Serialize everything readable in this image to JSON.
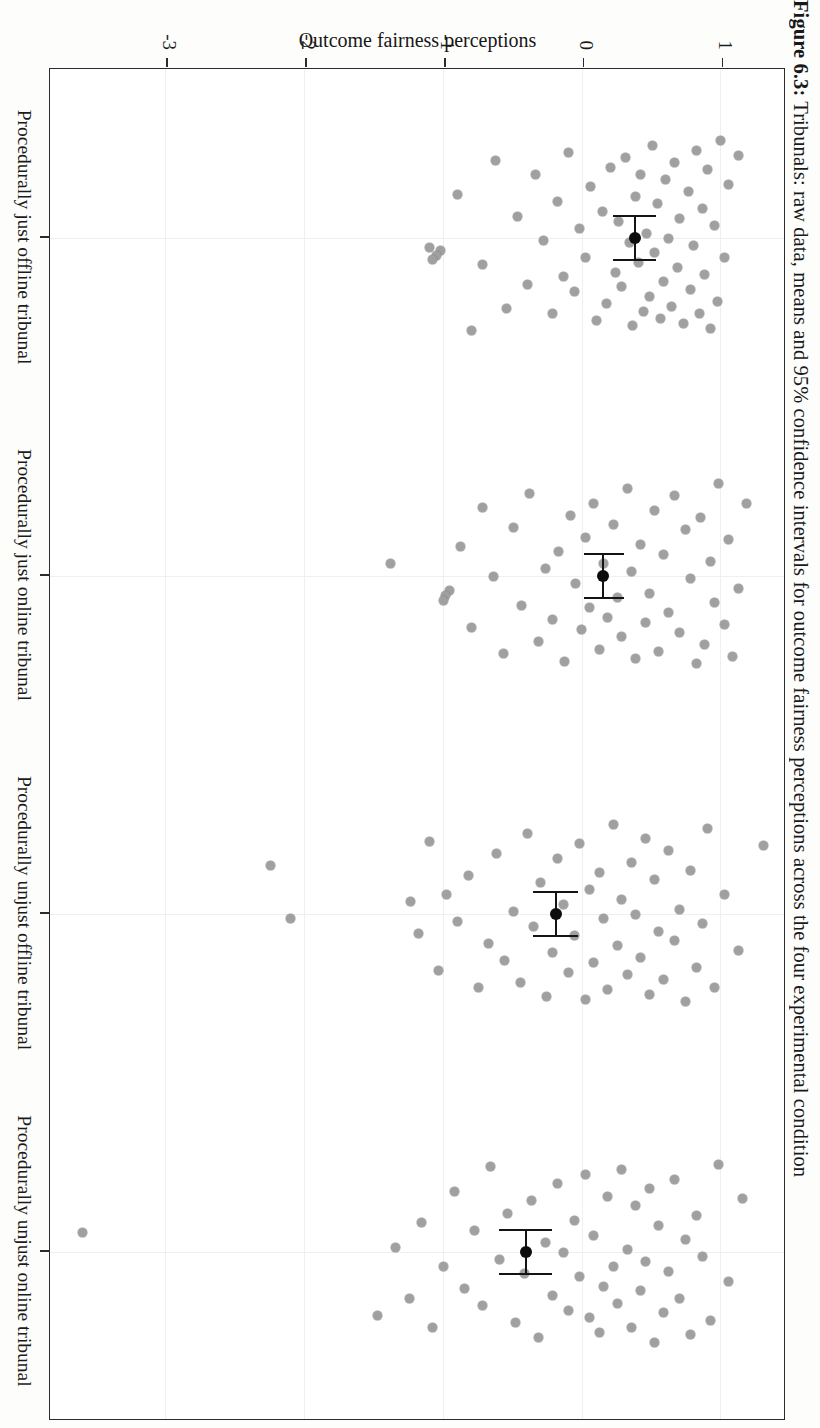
{
  "caption": {
    "lead": "Figure 6.3:",
    "rest": " Tribunals: raw data, means and 95% confidence intervals for outcome fairness perceptions across the four experimental condition"
  },
  "chart_data": {
    "type": "scatter",
    "title": "Figure 6.3: Tribunals: raw data, means and 95% confidence intervals for outcome fairness perceptions across the four experimental condition",
    "xlabel": "",
    "ylabel": "Outcome fairness perceptions",
    "ylim": [
      -3.85,
      1.45
    ],
    "yticks": [
      1,
      0,
      -1,
      -2,
      -3
    ],
    "ytick_labels": [
      "1",
      "0",
      "-1",
      "-2",
      "-3"
    ],
    "grid": true,
    "legend": "none",
    "orientation": "rotated-90ccw-scan",
    "categories": [
      "Procedurally just offline tribunal",
      "Procedurally just online tribunal",
      "Procedurally unjust offline tribunal",
      "Procedurally unjust online tribunal"
    ],
    "series": [
      {
        "name": "Mean with 95% CI",
        "means": [
          0.38,
          0.15,
          -0.19,
          -0.41
        ],
        "ci_low": [
          0.22,
          0.01,
          -0.36,
          -0.6
        ],
        "ci_high": [
          0.53,
          0.3,
          -0.03,
          -0.22
        ]
      }
    ],
    "raw_points": {
      "Procedurally just offline tribunal": [
        {
          "v": 1.12,
          "j": -0.34
        },
        {
          "v": 1.05,
          "j": -0.22
        },
        {
          "v": 1.02,
          "j": 0.08
        },
        {
          "v": 0.99,
          "j": -0.4
        },
        {
          "v": 0.97,
          "j": 0.26
        },
        {
          "v": 0.95,
          "j": -0.05
        },
        {
          "v": 0.92,
          "j": 0.37
        },
        {
          "v": 0.9,
          "j": -0.28
        },
        {
          "v": 0.88,
          "j": 0.15
        },
        {
          "v": 0.86,
          "j": -0.12
        },
        {
          "v": 0.84,
          "j": 0.31
        },
        {
          "v": 0.82,
          "j": -0.36
        },
        {
          "v": 0.8,
          "j": 0.03
        },
        {
          "v": 0.78,
          "j": 0.21
        },
        {
          "v": 0.76,
          "j": -0.19
        },
        {
          "v": 0.73,
          "j": 0.35
        },
        {
          "v": 0.7,
          "j": -0.08
        },
        {
          "v": 0.68,
          "j": 0.12
        },
        {
          "v": 0.66,
          "j": -0.31
        },
        {
          "v": 0.64,
          "j": 0.28
        },
        {
          "v": 0.62,
          "j": 0.0
        },
        {
          "v": 0.6,
          "j": -0.24
        },
        {
          "v": 0.58,
          "j": 0.18
        },
        {
          "v": 0.56,
          "j": 0.33
        },
        {
          "v": 0.54,
          "j": -0.14
        },
        {
          "v": 0.52,
          "j": 0.06
        },
        {
          "v": 0.5,
          "j": -0.38
        },
        {
          "v": 0.48,
          "j": 0.24
        },
        {
          "v": 0.46,
          "j": -0.02
        },
        {
          "v": 0.44,
          "j": 0.3
        },
        {
          "v": 0.42,
          "j": -0.26
        },
        {
          "v": 0.4,
          "j": 0.1
        },
        {
          "v": 0.38,
          "j": -0.17
        },
        {
          "v": 0.36,
          "j": 0.36
        },
        {
          "v": 0.34,
          "j": 0.02
        },
        {
          "v": 0.31,
          "j": -0.33
        },
        {
          "v": 0.28,
          "j": 0.2
        },
        {
          "v": 0.26,
          "j": -0.07
        },
        {
          "v": 0.24,
          "j": 0.14
        },
        {
          "v": 0.2,
          "j": -0.29
        },
        {
          "v": 0.17,
          "j": 0.27
        },
        {
          "v": 0.14,
          "j": -0.11
        },
        {
          "v": 0.1,
          "j": 0.34
        },
        {
          "v": 0.06,
          "j": -0.21
        },
        {
          "v": 0.02,
          "j": 0.08
        },
        {
          "v": -0.02,
          "j": -0.04
        },
        {
          "v": -0.06,
          "j": 0.22
        },
        {
          "v": -0.1,
          "j": -0.35
        },
        {
          "v": -0.14,
          "j": 0.16
        },
        {
          "v": -0.18,
          "j": -0.15
        },
        {
          "v": -0.22,
          "j": 0.31
        },
        {
          "v": -0.28,
          "j": 0.01
        },
        {
          "v": -0.34,
          "j": -0.26
        },
        {
          "v": -0.4,
          "j": 0.19
        },
        {
          "v": -0.47,
          "j": -0.09
        },
        {
          "v": -0.55,
          "j": 0.29
        },
        {
          "v": -0.63,
          "j": -0.32
        },
        {
          "v": -0.72,
          "j": 0.11
        },
        {
          "v": -0.8,
          "j": 0.38
        },
        {
          "v": -0.9,
          "j": -0.18
        },
        {
          "v": -1.02,
          "j": 0.05
        },
        {
          "v": -1.05,
          "j": 0.07
        },
        {
          "v": -1.08,
          "j": 0.09
        },
        {
          "v": -1.1,
          "j": 0.04
        }
      ],
      "Procedurally just online tribunal": [
        {
          "v": 1.18,
          "j": -0.3
        },
        {
          "v": 1.12,
          "j": 0.05
        },
        {
          "v": 1.08,
          "j": 0.33
        },
        {
          "v": 1.05,
          "j": -0.15
        },
        {
          "v": 1.02,
          "j": 0.2
        },
        {
          "v": 0.98,
          "j": -0.38
        },
        {
          "v": 0.95,
          "j": 0.11
        },
        {
          "v": 0.92,
          "j": -0.06
        },
        {
          "v": 0.88,
          "j": 0.28
        },
        {
          "v": 0.85,
          "j": -0.24
        },
        {
          "v": 0.82,
          "j": 0.36
        },
        {
          "v": 0.78,
          "j": 0.01
        },
        {
          "v": 0.74,
          "j": -0.19
        },
        {
          "v": 0.7,
          "j": 0.23
        },
        {
          "v": 0.66,
          "j": -0.33
        },
        {
          "v": 0.62,
          "j": 0.15
        },
        {
          "v": 0.58,
          "j": -0.09
        },
        {
          "v": 0.55,
          "j": 0.31
        },
        {
          "v": 0.52,
          "j": -0.27
        },
        {
          "v": 0.48,
          "j": 0.07
        },
        {
          "v": 0.45,
          "j": 0.19
        },
        {
          "v": 0.42,
          "j": -0.13
        },
        {
          "v": 0.38,
          "j": 0.34
        },
        {
          "v": 0.35,
          "j": -0.02
        },
        {
          "v": 0.32,
          "j": -0.36
        },
        {
          "v": 0.28,
          "j": 0.25
        },
        {
          "v": 0.25,
          "j": 0.09
        },
        {
          "v": 0.22,
          "j": -0.21
        },
        {
          "v": 0.18,
          "j": 0.17
        },
        {
          "v": 0.15,
          "j": -0.05
        },
        {
          "v": 0.12,
          "j": 0.3
        },
        {
          "v": 0.08,
          "j": -0.3
        },
        {
          "v": 0.05,
          "j": 0.13
        },
        {
          "v": 0.02,
          "j": -0.16
        },
        {
          "v": -0.01,
          "j": 0.22
        },
        {
          "v": -0.05,
          "j": 0.03
        },
        {
          "v": -0.09,
          "j": -0.25
        },
        {
          "v": -0.13,
          "j": 0.35
        },
        {
          "v": -0.17,
          "j": -0.1
        },
        {
          "v": -0.22,
          "j": 0.18
        },
        {
          "v": -0.27,
          "j": -0.03
        },
        {
          "v": -0.32,
          "j": 0.27
        },
        {
          "v": -0.38,
          "j": -0.34
        },
        {
          "v": -0.44,
          "j": 0.12
        },
        {
          "v": -0.5,
          "j": -0.2
        },
        {
          "v": -0.57,
          "j": 0.32
        },
        {
          "v": -0.64,
          "j": 0.0
        },
        {
          "v": -0.72,
          "j": -0.28
        },
        {
          "v": -0.8,
          "j": 0.21
        },
        {
          "v": -0.88,
          "j": -0.12
        },
        {
          "v": -0.96,
          "j": 0.06
        },
        {
          "v": -0.99,
          "j": 0.08
        },
        {
          "v": -1.0,
          "j": 0.1
        },
        {
          "v": -1.38,
          "j": -0.05
        }
      ],
      "Procedurally unjust offline tribunal": [
        {
          "v": 1.3,
          "j": -0.28
        },
        {
          "v": 1.12,
          "j": 0.15
        },
        {
          "v": 1.02,
          "j": -0.08
        },
        {
          "v": 0.95,
          "j": 0.3
        },
        {
          "v": 0.9,
          "j": -0.35
        },
        {
          "v": 0.86,
          "j": 0.04
        },
        {
          "v": 0.82,
          "j": 0.22
        },
        {
          "v": 0.78,
          "j": -0.18
        },
        {
          "v": 0.74,
          "j": 0.36
        },
        {
          "v": 0.7,
          "j": -0.02
        },
        {
          "v": 0.66,
          "j": 0.11
        },
        {
          "v": 0.62,
          "j": -0.26
        },
        {
          "v": 0.58,
          "j": 0.27
        },
        {
          "v": 0.55,
          "j": 0.07
        },
        {
          "v": 0.52,
          "j": -0.14
        },
        {
          "v": 0.48,
          "j": 0.33
        },
        {
          "v": 0.45,
          "j": -0.31
        },
        {
          "v": 0.42,
          "j": 0.18
        },
        {
          "v": 0.38,
          "j": 0.0
        },
        {
          "v": 0.35,
          "j": -0.21
        },
        {
          "v": 0.32,
          "j": 0.25
        },
        {
          "v": 0.28,
          "j": -0.06
        },
        {
          "v": 0.25,
          "j": 0.13
        },
        {
          "v": 0.22,
          "j": -0.37
        },
        {
          "v": 0.18,
          "j": 0.31
        },
        {
          "v": 0.15,
          "j": 0.02
        },
        {
          "v": 0.12,
          "j": -0.17
        },
        {
          "v": 0.08,
          "j": 0.2
        },
        {
          "v": 0.05,
          "j": -0.1
        },
        {
          "v": 0.02,
          "j": 0.35
        },
        {
          "v": -0.02,
          "j": -0.29
        },
        {
          "v": -0.06,
          "j": 0.09
        },
        {
          "v": -0.1,
          "j": 0.24
        },
        {
          "v": -0.14,
          "j": -0.04
        },
        {
          "v": -0.18,
          "j": -0.23
        },
        {
          "v": -0.22,
          "j": 0.16
        },
        {
          "v": -0.26,
          "j": 0.34
        },
        {
          "v": -0.3,
          "j": -0.13
        },
        {
          "v": -0.35,
          "j": 0.05
        },
        {
          "v": -0.4,
          "j": -0.33
        },
        {
          "v": -0.45,
          "j": 0.28
        },
        {
          "v": -0.5,
          "j": -0.01
        },
        {
          "v": -0.56,
          "j": 0.19
        },
        {
          "v": -0.62,
          "j": -0.25
        },
        {
          "v": -0.68,
          "j": 0.12
        },
        {
          "v": -0.75,
          "j": 0.3
        },
        {
          "v": -0.82,
          "j": -0.16
        },
        {
          "v": -0.9,
          "j": 0.03
        },
        {
          "v": -0.98,
          "j": -0.08
        },
        {
          "v": -1.04,
          "j": 0.23
        },
        {
          "v": -1.1,
          "j": -0.3
        },
        {
          "v": -1.18,
          "j": 0.08
        },
        {
          "v": -1.24,
          "j": -0.05
        },
        {
          "v": -2.1,
          "j": 0.02
        },
        {
          "v": -2.25,
          "j": -0.2
        }
      ],
      "Procedurally unjust online tribunal": [
        {
          "v": 1.15,
          "j": -0.22
        },
        {
          "v": 1.05,
          "j": 0.12
        },
        {
          "v": 0.98,
          "j": -0.36
        },
        {
          "v": 0.92,
          "j": 0.28
        },
        {
          "v": 0.86,
          "j": 0.02
        },
        {
          "v": 0.82,
          "j": -0.15
        },
        {
          "v": 0.78,
          "j": 0.34
        },
        {
          "v": 0.74,
          "j": -0.05
        },
        {
          "v": 0.7,
          "j": 0.19
        },
        {
          "v": 0.66,
          "j": -0.3
        },
        {
          "v": 0.62,
          "j": 0.08
        },
        {
          "v": 0.58,
          "j": 0.25
        },
        {
          "v": 0.55,
          "j": -0.11
        },
        {
          "v": 0.52,
          "j": 0.37
        },
        {
          "v": 0.48,
          "j": -0.26
        },
        {
          "v": 0.45,
          "j": 0.04
        },
        {
          "v": 0.42,
          "j": 0.16
        },
        {
          "v": 0.38,
          "j": -0.19
        },
        {
          "v": 0.35,
          "j": 0.31
        },
        {
          "v": 0.32,
          "j": -0.01
        },
        {
          "v": 0.28,
          "j": -0.34
        },
        {
          "v": 0.25,
          "j": 0.21
        },
        {
          "v": 0.22,
          "j": 0.06
        },
        {
          "v": 0.18,
          "j": -0.23
        },
        {
          "v": 0.15,
          "j": 0.14
        },
        {
          "v": 0.12,
          "j": 0.33
        },
        {
          "v": 0.08,
          "j": -0.07
        },
        {
          "v": 0.05,
          "j": 0.27
        },
        {
          "v": 0.02,
          "j": -0.32
        },
        {
          "v": -0.02,
          "j": 0.1
        },
        {
          "v": -0.06,
          "j": -0.13
        },
        {
          "v": -0.1,
          "j": 0.24
        },
        {
          "v": -0.14,
          "j": 0.0
        },
        {
          "v": -0.18,
          "j": -0.28
        },
        {
          "v": -0.22,
          "j": 0.18
        },
        {
          "v": -0.27,
          "j": -0.04
        },
        {
          "v": -0.32,
          "j": 0.35
        },
        {
          "v": -0.37,
          "j": -0.21
        },
        {
          "v": -0.42,
          "j": 0.09
        },
        {
          "v": -0.48,
          "j": 0.29
        },
        {
          "v": -0.54,
          "j": -0.16
        },
        {
          "v": -0.6,
          "j": 0.03
        },
        {
          "v": -0.66,
          "j": -0.35
        },
        {
          "v": -0.72,
          "j": 0.22
        },
        {
          "v": -0.78,
          "j": -0.09
        },
        {
          "v": -0.85,
          "j": 0.15
        },
        {
          "v": -0.92,
          "j": -0.25
        },
        {
          "v": -1.0,
          "j": 0.06
        },
        {
          "v": -1.08,
          "j": 0.31
        },
        {
          "v": -1.16,
          "j": -0.12
        },
        {
          "v": -1.25,
          "j": 0.19
        },
        {
          "v": -1.35,
          "j": -0.02
        },
        {
          "v": -1.48,
          "j": 0.26
        },
        {
          "v": -3.6,
          "j": -0.08
        }
      ]
    }
  }
}
